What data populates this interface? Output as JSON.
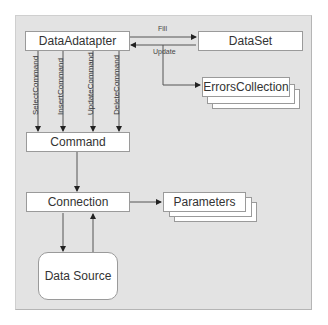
{
  "diagram": {
    "nodes": {
      "data_adapter": "DataAdatapter",
      "dataset": "DataSet",
      "errors_collection": "ErrorsCollection",
      "command": "Command",
      "connection": "Connection",
      "parameters": "Parameters",
      "data_source": "Data Source"
    },
    "edges": {
      "fill": "Fill",
      "update": "Update",
      "select_command": "SelectCommand",
      "insert_command": "InsertCommand",
      "update_command": "UpdateCommand",
      "delete_command": "DeleteCommand"
    },
    "colors": {
      "background": "#e3e3e3",
      "box_fill": "#ffffff",
      "box_border": "#9a9a9a",
      "line": "#555555"
    }
  }
}
